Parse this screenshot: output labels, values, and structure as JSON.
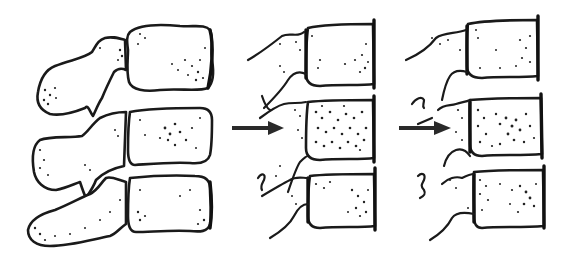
{
  "figure": {
    "description": "Three-panel line drawing of lumbar vertebral segments (lateral view) showing progressive loss of posterior elements",
    "background": "#ffffff",
    "ink_color": "#1a1a1a",
    "panels": [
      {
        "id": "panel-1",
        "label": "Intact vertebral segments with posterior elements",
        "vertebrae_count": 3,
        "has_arrow": false
      },
      {
        "id": "panel-2",
        "label": "Vertebral segments with disrupted posterior elements",
        "vertebrae_count": 3,
        "has_arrow": true,
        "arrow_direction": "right"
      },
      {
        "id": "panel-3",
        "label": "Vertebral segments with fragmented posterior elements",
        "vertebrae_count": 3,
        "has_arrow": true,
        "arrow_direction": "right"
      }
    ]
  }
}
